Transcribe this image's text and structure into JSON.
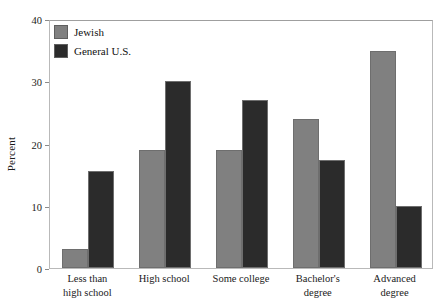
{
  "chart_data": {
    "type": "bar",
    "title": "",
    "subtitle": "",
    "xlabel": "",
    "ylabel": "Percent",
    "ylim": [
      0,
      40
    ],
    "yticks": [
      0,
      10,
      20,
      30,
      40
    ],
    "ytick_labels": [
      "0",
      "10",
      "20",
      "30",
      "40"
    ],
    "grid": false,
    "legend_position": "top-left",
    "categories": [
      "Less than high school",
      "High school",
      "Some college",
      "Bachelor's degree",
      "Advanced degree"
    ],
    "category_lines": [
      [
        "Less than",
        "high school"
      ],
      [
        "High school",
        ""
      ],
      [
        "Some college",
        ""
      ],
      [
        "Bachelor's",
        "degree"
      ],
      [
        "Advanced",
        "degree"
      ]
    ],
    "series": [
      {
        "name": "Jewish",
        "color": "#808080",
        "values": [
          3,
          19,
          19,
          24,
          34.8
        ]
      },
      {
        "name": "General U.S.",
        "color": "#2b2b2b",
        "values": [
          15.6,
          30,
          27,
          17.4,
          10
        ]
      }
    ]
  },
  "colors": {
    "series_jewish": "#808080",
    "series_general_us": "#2b2b2b",
    "bar_outline": "#6e6e6e",
    "frame": "#b9b9b9",
    "text": "#1a1a1a",
    "background": "#ffffff"
  }
}
